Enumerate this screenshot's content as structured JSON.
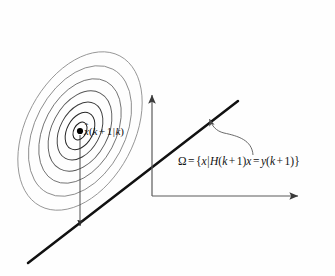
{
  "figure": {
    "background_color": "#fefefe",
    "width": 335,
    "height": 276
  },
  "labels": {
    "state_estimate": {
      "text": "x̂(k + 1|k)",
      "parts": {
        "symbol": "x",
        "hat": "̂",
        "open_paren": "(",
        "k": "k",
        "plus": "+",
        "one": "1",
        "bar": "|",
        "k2": "k",
        "close_paren": ")"
      },
      "color": "#111111"
    },
    "constraint_set": {
      "text": "Ω = {x|H(k + 1)x = y(k + 1)}",
      "parts": {
        "omega": "Ω",
        "equals": "=",
        "open_brace": "{",
        "x": "x",
        "bar": "|",
        "H": "H",
        "open_paren": "(",
        "k": "k",
        "plus": "+",
        "one": "1",
        "close_paren": ")",
        "x2": "x",
        "equals2": "=",
        "y": "y",
        "open_paren2": "(",
        "k2": "k",
        "plus2": "+",
        "one2": "1",
        "close_paren2": ")",
        "close_brace": "}"
      },
      "color": "#111111"
    }
  },
  "elements": {
    "contour_ellipses": {
      "name": "covariance-contours",
      "count": 7,
      "center_x": 80,
      "center_y": 131,
      "rotation_deg": -62,
      "stroke_color": "#6f6f6f",
      "inner_stroke_color": "#1a1a1a",
      "radii_x": [
        9,
        20,
        31,
        43,
        56,
        70,
        85
      ],
      "radii_y": [
        6,
        13,
        20,
        28,
        36,
        45,
        54
      ]
    },
    "center_dot": {
      "name": "state-estimate-point",
      "x": 80,
      "y": 131,
      "radius": 3,
      "color": "#000000"
    },
    "projection_arrow": {
      "name": "projection-arrow",
      "from_x": 80,
      "from_y": 134,
      "to_x": 80,
      "to_y": 228,
      "color": "#333333"
    },
    "constraint_line": {
      "name": "constraint-line",
      "x1": 28,
      "y1": 263,
      "x2": 238,
      "y2": 101,
      "color": "#111111",
      "stroke_width": 2.4
    },
    "vertical_axis": {
      "name": "vertical-axis",
      "x": 152,
      "y_bottom": 196,
      "y_top": 92,
      "color": "#555555"
    },
    "horizontal_axis": {
      "name": "horizontal-axis",
      "y": 196,
      "x_left": 152,
      "x_right": 302,
      "color": "#555555"
    },
    "pointer_arrow": {
      "name": "constraint-pointer-arrow",
      "tip_x": 208,
      "tip_y": 117,
      "tail_x": 246,
      "tail_y": 152,
      "color": "#555555"
    }
  }
}
